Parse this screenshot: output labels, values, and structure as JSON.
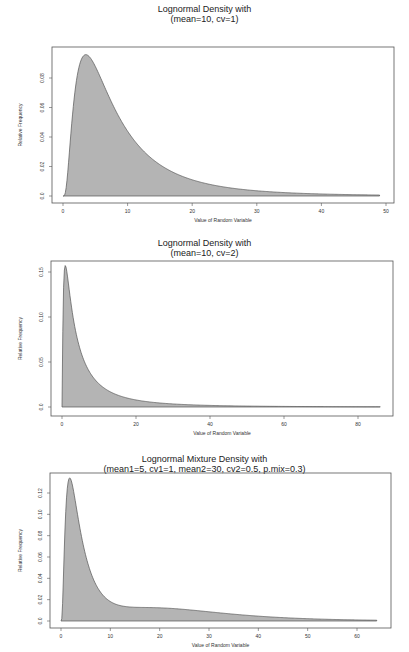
{
  "chart_data": [
    {
      "type": "area",
      "title": "Lognormal Density with",
      "subtitle": "(mean=10, cv=1)",
      "xlabel": "Value of Random Variable",
      "ylabel": "Relative Frequency",
      "distribution": {
        "kind": "lognormal",
        "mean": 10,
        "cv": 1
      },
      "x_range_data": [
        0,
        49
      ],
      "xlim": [
        0,
        50
      ],
      "ylim": [
        0,
        0.096
      ],
      "xticks": [
        0,
        10,
        20,
        30,
        40,
        50
      ],
      "xtick_labels": [
        "0",
        "10",
        "20",
        "30",
        "40",
        "50"
      ],
      "yticks": [
        0.0,
        0.02,
        0.04,
        0.06,
        0.08
      ],
      "ytick_labels": [
        "0.0",
        "0.02",
        "0.04",
        "0.06",
        "0.08"
      ],
      "grid": false,
      "fill_color": "#b4b4b4",
      "x": [
        0,
        1,
        2,
        3,
        4,
        5,
        6,
        8,
        10,
        15,
        20,
        25,
        30,
        40,
        49
      ],
      "values": [
        0,
        0.032,
        0.082,
        0.094,
        0.093,
        0.086,
        0.077,
        0.06,
        0.046,
        0.024,
        0.013,
        0.0075,
        0.0045,
        0.0017,
        0.0007
      ]
    },
    {
      "type": "area",
      "title": "Lognormal Density with",
      "subtitle": "(mean=10, cv=2)",
      "xlabel": "Value of Random Variable",
      "ylabel": "Relative Frequency",
      "distribution": {
        "kind": "lognormal",
        "mean": 10,
        "cv": 2
      },
      "x_range_data": [
        0,
        86
      ],
      "xlim": [
        0,
        88
      ],
      "ylim": [
        0,
        0.162
      ],
      "xticks": [
        0,
        20,
        40,
        60,
        80
      ],
      "xtick_labels": [
        "0",
        "20",
        "40",
        "60",
        "80"
      ],
      "yticks": [
        0.0,
        0.05,
        0.1,
        0.15
      ],
      "ytick_labels": [
        "0.0",
        "0.05",
        "0.10",
        "0.15"
      ],
      "grid": false,
      "fill_color": "#b4b4b4",
      "x": [
        0,
        1,
        2,
        3,
        5,
        10,
        15,
        20,
        30,
        40,
        60,
        86
      ],
      "values": [
        0,
        0.15,
        0.137,
        0.11,
        0.073,
        0.033,
        0.018,
        0.011,
        0.005,
        0.0027,
        0.001,
        0.0004
      ]
    },
    {
      "type": "area",
      "title": "Lognormal Mixture Density with",
      "subtitle": "(mean1=5, cv1=1, mean2=30, cv2=0.5, p.mix=0.3)",
      "xlabel": "Value of Random Variable",
      "ylabel": "Relative Frequency",
      "distribution": {
        "kind": "lognormal-mixture",
        "mean1": 5,
        "cv1": 1,
        "mean2": 30,
        "cv2": 0.5,
        "p_mix": 0.3
      },
      "x_range_data": [
        0,
        64
      ],
      "xlim": [
        0,
        66
      ],
      "ylim": [
        0,
        0.138
      ],
      "xticks": [
        0,
        10,
        20,
        30,
        40,
        50,
        60
      ],
      "xtick_labels": [
        "0",
        "10",
        "20",
        "30",
        "40",
        "50",
        "60"
      ],
      "yticks": [
        0.0,
        0.02,
        0.04,
        0.06,
        0.08,
        0.1,
        0.12
      ],
      "ytick_labels": [
        "0.0",
        "0.02",
        "0.04",
        "0.06",
        "0.08",
        "0.10",
        "0.12"
      ],
      "grid": false,
      "fill_color": "#b4b4b4",
      "x": [
        0,
        1,
        2,
        3,
        5,
        8,
        10,
        15,
        20,
        25,
        30,
        40,
        50,
        64
      ],
      "values": [
        0,
        0.1,
        0.132,
        0.122,
        0.08,
        0.038,
        0.022,
        0.013,
        0.012,
        0.01,
        0.008,
        0.0045,
        0.0022,
        0.0008
      ]
    }
  ],
  "layout": [
    {
      "title_top": 5,
      "frame": [
        52,
        47,
        394,
        203
      ],
      "x0px": 63,
      "x1px": 386,
      "y0px": 196,
      "y1px": 78,
      "y1val": 0.08
    },
    {
      "title_top": 239,
      "frame": [
        51,
        261,
        393,
        416
      ],
      "x0px": 62,
      "x1px": 358,
      "y0px": 407,
      "y1px": 272,
      "y1val": 0.15
    },
    {
      "title_top": 455,
      "frame": [
        50,
        473,
        391,
        628
      ],
      "x0px": 61,
      "x1px": 357,
      "y0px": 621,
      "y1px": 493,
      "y1val": 0.12
    }
  ]
}
